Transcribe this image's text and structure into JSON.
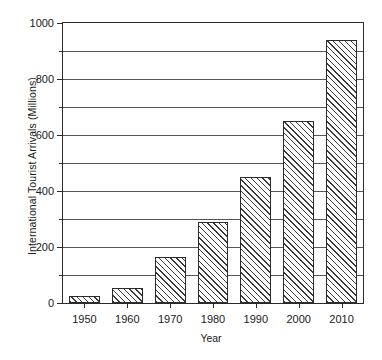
{
  "chart_data": {
    "type": "bar",
    "title": "",
    "xlabel": "Year",
    "ylabel": "International Tourist Arrivals (Millions)",
    "categories": [
      "1950",
      "1960",
      "1970",
      "1980",
      "1990",
      "2000",
      "2010"
    ],
    "values": [
      25,
      55,
      165,
      290,
      450,
      650,
      940
    ],
    "ylim": [
      0,
      1000
    ],
    "y_major_ticks": [
      0,
      200,
      400,
      600,
      800,
      1000
    ],
    "y_minor_ticks": [
      100,
      300,
      500,
      700,
      900
    ],
    "y_tick_labels": [
      "0",
      "200",
      "400",
      "600",
      "800",
      "1000"
    ],
    "gridlines": [
      100,
      200,
      300,
      400,
      500,
      600,
      700,
      800,
      900
    ],
    "grid": true,
    "legend": "none",
    "series": [
      {
        "name": "International Tourist Arrivals",
        "values": [
          25,
          55,
          165,
          290,
          450,
          650,
          940
        ],
        "fill": "diagonal-hatch",
        "edge_color": "#2b2b2b",
        "hatch_color": "#3a3a3a"
      }
    ]
  },
  "axes": {
    "x_title": "Year",
    "y_title": "International Tourist Arrivals (Millions)"
  },
  "colors": {
    "background": "#ffffff",
    "axis": "#2b2b2b",
    "grid": "#555555",
    "text": "#1a1a1a"
  }
}
